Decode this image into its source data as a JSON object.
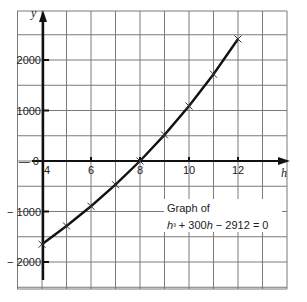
{
  "chart_data": {
    "type": "line",
    "title": "",
    "annotation": {
      "line1": "Graph of",
      "line2": "h³ + 300h − 2912 = 0"
    },
    "xlabel": "h",
    "ylabel": "y",
    "x_ticks": [
      4,
      6,
      8,
      10,
      12
    ],
    "y_ticks": [
      -2000,
      -1000,
      0,
      1000,
      2000
    ],
    "xlim": [
      3,
      14
    ],
    "ylim": [
      -2500,
      3000
    ],
    "grid": true,
    "x": [
      4,
      5,
      6,
      7,
      8,
      9,
      10,
      11,
      12
    ],
    "series": [
      {
        "name": "y = h³ + 300h − 2912",
        "values": [
          -1648,
          -1287,
          -896,
          -469,
          0,
          517,
          1088,
          1719,
          2416
        ],
        "marker": "x"
      }
    ],
    "root": {
      "h": 8,
      "y": 0
    }
  },
  "labels": {
    "x_axis": "h",
    "y_axis": "y",
    "x_ticks": [
      "4",
      "6",
      "8",
      "10",
      "12"
    ],
    "y_ticks": [
      "2000",
      "1000",
      "0",
      "− 1000",
      "− 2000"
    ],
    "annotation_line1": "Graph of",
    "annotation_line2_base": "h³ + 300h − 2912 = 0"
  }
}
